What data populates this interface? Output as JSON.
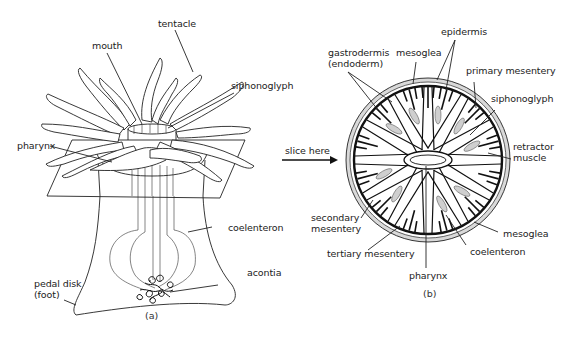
{
  "figure": {
    "panel_a": {
      "caption": "(a)",
      "labels": {
        "tentacle": "tentacle",
        "mouth": "mouth",
        "siphonoglyph": "siphonoglyph",
        "pharynx": "pharynx",
        "coelenteron": "coelenteron",
        "acontia": "acontia",
        "pedal_disk_line1": "pedal disk",
        "pedal_disk_line2": "(foot)"
      }
    },
    "arrow": {
      "label": "slice here"
    },
    "panel_b": {
      "caption": "(b)",
      "labels": {
        "epidermis": "epidermis",
        "gastrodermis_line1": "gastrodermis",
        "gastrodermis_line2": "(endoderm)",
        "mesoglea_top": "mesoglea",
        "primary_mesentery": "primary mesentery",
        "siphonoglyph": "siphonoglyph",
        "retractor_line1": "retractor",
        "retractor_line2": "muscle",
        "secondary_line1": "secondary",
        "secondary_line2": "mesentery",
        "mesoglea_bottom": "mesoglea",
        "tertiary_mesentery": "tertiary mesentery",
        "coelenteron": "coelenteron",
        "pharynx": "pharynx"
      }
    },
    "colors": {
      "line": "#222222",
      "mesoglea_fill": "#d9d9d9",
      "background": "#ffffff"
    }
  }
}
